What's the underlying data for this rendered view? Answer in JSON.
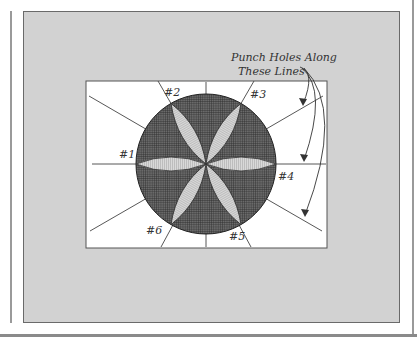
{
  "figure": {
    "callout": {
      "line1": "Punch Holes Along",
      "line2": "These Lines"
    },
    "labels": [
      {
        "id": "1",
        "text": "#1"
      },
      {
        "id": "2",
        "text": "#2"
      },
      {
        "id": "3",
        "text": "#3"
      },
      {
        "id": "4",
        "text": "#4"
      },
      {
        "id": "5",
        "text": "#5"
      },
      {
        "id": "6",
        "text": "#6"
      }
    ],
    "colors": {
      "background_panel": "#d2d2d2",
      "inner_panel": "#ffffff",
      "disc": "#4a4a4a",
      "petal": "#cfcfcf",
      "lines": "#333333"
    }
  }
}
